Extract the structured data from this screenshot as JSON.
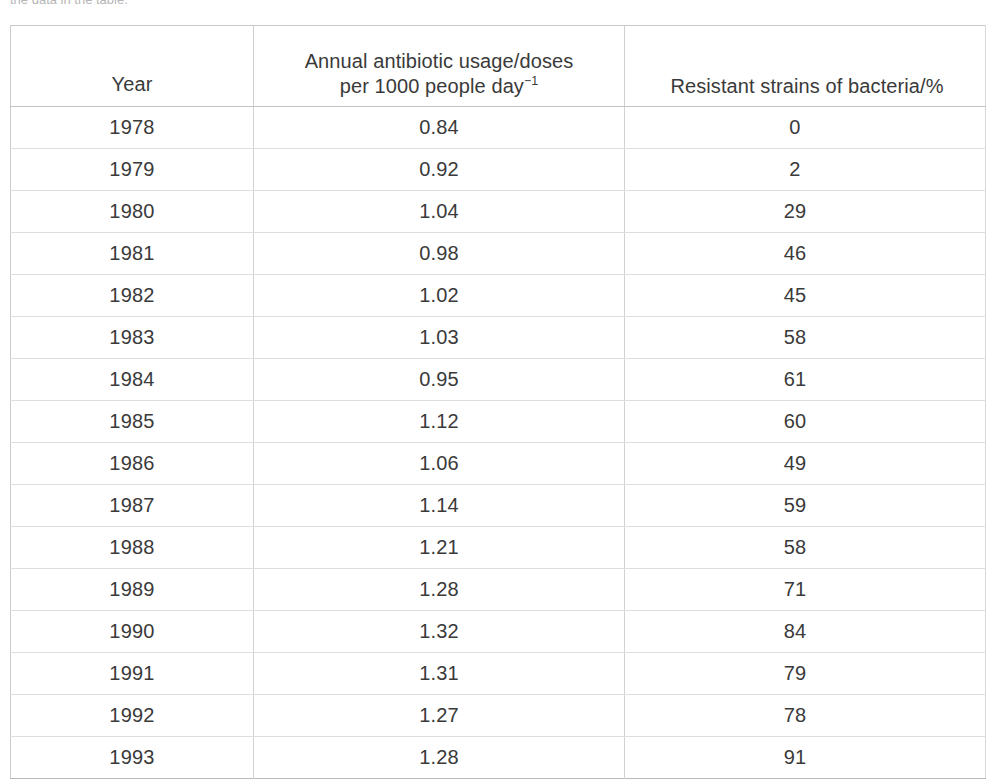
{
  "page": {
    "intro_text_clipped": "the data in the table."
  },
  "table": {
    "headers": {
      "year": "Year",
      "usage_line1": "Annual antibiotic usage/doses",
      "usage_line2_prefix": "per 1000 people day",
      "usage_line2_sup": "−1",
      "resistance": "Resistant strains of bacteria/%"
    },
    "rows": [
      {
        "year": "1978",
        "usage": "0.84",
        "resistance": "0"
      },
      {
        "year": "1979",
        "usage": "0.92",
        "resistance": "2"
      },
      {
        "year": "1980",
        "usage": "1.04",
        "resistance": "29"
      },
      {
        "year": "1981",
        "usage": "0.98",
        "resistance": "46"
      },
      {
        "year": "1982",
        "usage": "1.02",
        "resistance": "45"
      },
      {
        "year": "1983",
        "usage": "1.03",
        "resistance": "58"
      },
      {
        "year": "1984",
        "usage": "0.95",
        "resistance": "61"
      },
      {
        "year": "1985",
        "usage": "1.12",
        "resistance": "60"
      },
      {
        "year": "1986",
        "usage": "1.06",
        "resistance": "49"
      },
      {
        "year": "1987",
        "usage": "1.14",
        "resistance": "59"
      },
      {
        "year": "1988",
        "usage": "1.21",
        "resistance": "58"
      },
      {
        "year": "1989",
        "usage": "1.28",
        "resistance": "71"
      },
      {
        "year": "1990",
        "usage": "1.32",
        "resistance": "84"
      },
      {
        "year": "1991",
        "usage": "1.31",
        "resistance": "79"
      },
      {
        "year": "1992",
        "usage": "1.27",
        "resistance": "78"
      },
      {
        "year": "1993",
        "usage": "1.28",
        "resistance": "91"
      }
    ]
  },
  "chart_data": {
    "type": "table",
    "title": "",
    "columns": [
      "Year",
      "Annual antibiotic usage/doses per 1000 people day−1",
      "Resistant strains of bacteria/%"
    ],
    "x": [
      1978,
      1979,
      1980,
      1981,
      1982,
      1983,
      1984,
      1985,
      1986,
      1987,
      1988,
      1989,
      1990,
      1991,
      1992,
      1993
    ],
    "series": [
      {
        "name": "Annual antibiotic usage/doses per 1000 people day−1",
        "values": [
          0.84,
          0.92,
          1.04,
          0.98,
          1.02,
          1.03,
          0.95,
          1.12,
          1.06,
          1.14,
          1.21,
          1.28,
          1.32,
          1.31,
          1.27,
          1.28
        ]
      },
      {
        "name": "Resistant strains of bacteria/%",
        "values": [
          0,
          2,
          29,
          46,
          45,
          58,
          61,
          60,
          49,
          59,
          58,
          71,
          84,
          79,
          78,
          91
        ]
      }
    ],
    "xlabel": "Year",
    "ylabel": "",
    "grid": true
  },
  "colors": {
    "text": "#3a3a3a",
    "border": "#d2d2d2",
    "background": "#ffffff"
  }
}
